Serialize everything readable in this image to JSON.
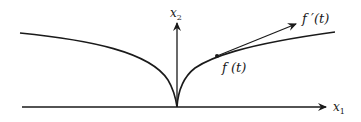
{
  "diagram": {
    "axes": {
      "x_label": "x",
      "x_sub": "1",
      "y_label": "x",
      "y_sub": "2"
    },
    "curve": {
      "description": "cusp-shaped curve symmetric about x2 axis, cusp at origin"
    },
    "point_label": "f (t)",
    "tangent_label": "f ′(t)",
    "colors": {
      "stroke": "#1a1a1a",
      "background": "#ffffff"
    }
  }
}
